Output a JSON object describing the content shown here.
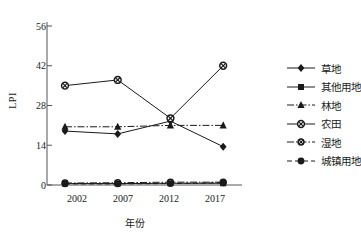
{
  "chart_data": {
    "type": "line",
    "title": "",
    "xlabel": "年份",
    "ylabel": "LPI",
    "categories": [
      "2002",
      "2007",
      "2012",
      "2017"
    ],
    "x": [
      2002,
      2007,
      2012,
      2017
    ],
    "ylim": [
      0,
      56
    ],
    "yticks": [
      0,
      14,
      28,
      42,
      56
    ],
    "grid": false,
    "legend_position": "right",
    "series": [
      {
        "name": "草地",
        "marker": "diamond",
        "line": "solid",
        "values": [
          19.0,
          18.0,
          22.5,
          13.5
        ]
      },
      {
        "name": "其他用地",
        "marker": "square",
        "line": "solid",
        "values": [
          0.5,
          0.5,
          0.6,
          0.6
        ]
      },
      {
        "name": "林地",
        "marker": "triangle",
        "line": "dashdot",
        "values": [
          20.5,
          20.5,
          21.0,
          21.0
        ]
      },
      {
        "name": "农田",
        "marker": "circle-cross",
        "line": "solid",
        "values": [
          35.0,
          37.0,
          23.5,
          42.0
        ]
      },
      {
        "name": "湿地",
        "marker": "circle-cross-sm",
        "line": "dashdot",
        "values": [
          0.7,
          0.8,
          1.0,
          1.0
        ]
      },
      {
        "name": "城镇用地",
        "marker": "circle-filled",
        "line": "dashed",
        "values": [
          0.4,
          0.4,
          0.5,
          0.8
        ]
      }
    ]
  },
  "axis": {
    "y_label": "LPI",
    "y_ticks": [
      "56",
      "42",
      "28",
      "14",
      "0"
    ],
    "x_ticks": [
      "2002",
      "2007",
      "2012",
      "2017"
    ],
    "x_title": "年份"
  },
  "legend": {
    "items": [
      {
        "label": "草地"
      },
      {
        "label": "其他用地"
      },
      {
        "label": "林地"
      },
      {
        "label": "农田"
      },
      {
        "label": "湿地"
      },
      {
        "label": "城镇用地"
      }
    ]
  },
  "colors": {
    "ink": "#1a1a1a",
    "axis": "#555555",
    "background": "#ffffff"
  }
}
